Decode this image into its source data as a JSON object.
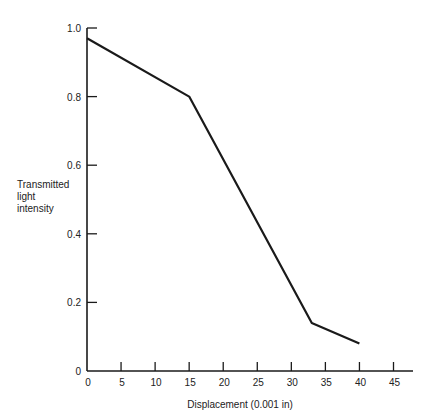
{
  "chart_data": {
    "type": "line",
    "title": "",
    "xlabel": "Displacement (0.001 in)",
    "ylabel": [
      "Transmitted",
      "light",
      "intensity"
    ],
    "xlim": [
      0,
      45
    ],
    "ylim": [
      0,
      1.0
    ],
    "x_ticks": [
      "0",
      "5",
      "10",
      "15",
      "20",
      "25",
      "30",
      "35",
      "40",
      "45"
    ],
    "y_ticks": [
      "0",
      "0.2",
      "0.4",
      "0.6",
      "0.8",
      "1.0"
    ],
    "grid": false,
    "legend": null,
    "series": [
      {
        "name": "Transmitted light intensity",
        "x": [
          0,
          15,
          33,
          40
        ],
        "y": [
          0.97,
          0.8,
          0.14,
          0.08
        ]
      }
    ]
  }
}
